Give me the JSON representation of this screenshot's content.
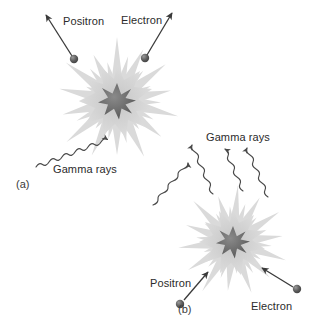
{
  "figure": {
    "background_color": "#ffffff",
    "ink_color": "#3a3a3a",
    "burst_outer_color": "#d4d4d4",
    "burst_mid_color": "#c9c9c9",
    "burst_core_color": "#6e6e6e",
    "particle_color": "#555555"
  },
  "panels": [
    {
      "id": "a",
      "label": "(a)",
      "label_x": 16,
      "label_y": 178,
      "burst": {
        "cx": 117,
        "cy": 101,
        "r_outer": 62,
        "r_core": 17
      },
      "particles": [
        {
          "name": "Positron",
          "label": "Positron",
          "dot_x": 74,
          "dot_y": 58,
          "label_x": 63,
          "label_y": 15,
          "direction": "outgoing-up-left"
        },
        {
          "name": "Electron",
          "label": "Electron",
          "dot_x": 145,
          "dot_y": 57,
          "label_x": 121,
          "label_y": 15,
          "direction": "outgoing-up-right"
        }
      ],
      "gamma": {
        "label": "Gamma rays",
        "label_x": 53,
        "label_y": 163,
        "rays": 2
      }
    },
    {
      "id": "b",
      "label": "(b)",
      "label_x": 178,
      "label_y": 303,
      "burst": {
        "cx": 233,
        "cy": 242,
        "r_outer": 56,
        "r_core": 15
      },
      "particles": [
        {
          "name": "Positron",
          "label": "Positron",
          "dot_x": 179,
          "dut_y": 303,
          "dot_y": 303,
          "label_x": 150,
          "label_y": 277,
          "direction": "incoming-up-right"
        },
        {
          "name": "Electron",
          "label": "Electron",
          "dot_x": 297,
          "dot_y": 290,
          "label_x": 251,
          "label_y": 300,
          "direction": "incoming-up-left"
        }
      ],
      "gamma": {
        "label": "Gamma rays",
        "label_x": 206,
        "label_y": 131,
        "rays": 3
      }
    }
  ],
  "labels": {
    "positron_a": "Positron",
    "electron_a": "Electron",
    "gamma_a": "Gamma rays",
    "panel_a": "(a)",
    "positron_b": "Positron",
    "electron_b": "Electron",
    "gamma_b": "Gamma rays",
    "panel_b": "(b)"
  }
}
